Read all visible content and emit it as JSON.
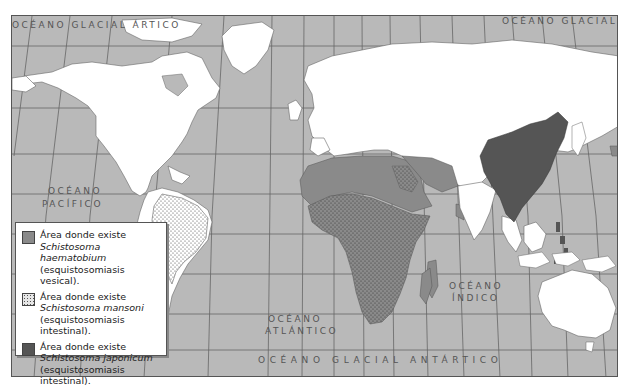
{
  "map": {
    "colors": {
      "ocean": "#b9b9b9",
      "land": "#ffffff",
      "haematobium": "#8a8a8a",
      "mansoni_pattern": "#555555",
      "japonicum": "#555555",
      "grid": "#555555"
    },
    "ocean_labels": {
      "arctic_left": "OCÉANO  GLACIAL  ÁRTICO",
      "arctic_right": "OCÉANO  GLACIAL  ÁRT",
      "pacific_line1": "OCÉANO",
      "pacific_line2": "PACÍFICO",
      "atlantic_line1": "OCÉANO",
      "atlantic_line2": "ATLÁNTICO",
      "indian_line1": "OCÉANO",
      "indian_line2": "ÍNDICO",
      "antarctic": "OCÉANO  GLACIAL  ANTÁRTICO"
    }
  },
  "legend": {
    "items": [
      {
        "swatch": "medium-gray",
        "line1": "Área donde existe",
        "species": "Schistosoma haematobium",
        "line3": "(esquistosomiasis vesical)."
      },
      {
        "swatch": "dotted",
        "line1": "Área donde existe",
        "species": "Schistosoma mansoni",
        "line3": "(esquistosomiasis intestinal)."
      },
      {
        "swatch": "dark-gray",
        "line1": "Área donde existe",
        "species": "Schistosoma japonicum",
        "line3": "(esquistosomiasis intestinal)."
      }
    ]
  }
}
